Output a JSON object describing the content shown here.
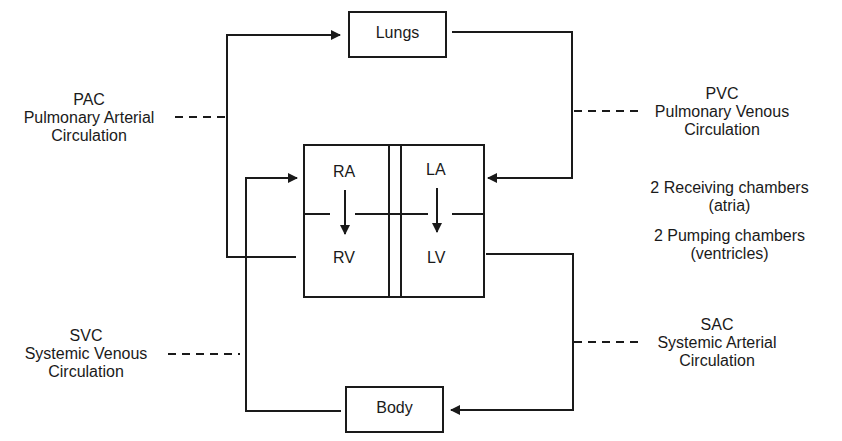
{
  "boxes": {
    "lungs": "Lungs",
    "body": "Body"
  },
  "chambers": {
    "ra": "RA",
    "rv": "RV",
    "la": "LA",
    "lv": "LV"
  },
  "circulations": {
    "pac": {
      "abbr": "PAC",
      "line1": "Pulmonary Arterial",
      "line2": "Circulation"
    },
    "pvc": {
      "abbr": "PVC",
      "line1": "Pulmonary Venous",
      "line2": "Circulation"
    },
    "svc": {
      "abbr": "SVC",
      "line1": "Systemic Venous",
      "line2": "Circulation"
    },
    "sac": {
      "abbr": "SAC",
      "line1": "Systemic Arterial",
      "line2": "Circulation"
    }
  },
  "notes": {
    "receiving": {
      "line1": "2 Receiving chambers",
      "line2": "(atria)"
    },
    "pumping": {
      "line1": "2 Pumping chambers",
      "line2": "(ventricles)"
    }
  },
  "colors": {
    "ink": "#1a1a1a",
    "background": "#ffffff"
  }
}
